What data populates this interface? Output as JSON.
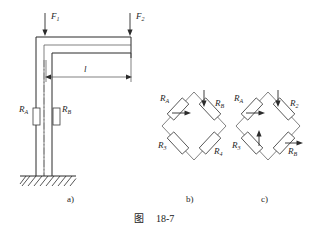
{
  "figure": {
    "caption_label": "图",
    "caption_number": "18-7",
    "parts": [
      {
        "id": "a",
        "label": "a)"
      },
      {
        "id": "b",
        "label": "b)"
      },
      {
        "id": "c",
        "label": "c)"
      }
    ]
  },
  "part_a": {
    "name": "cantilever-column-with-strain-gauges",
    "forces": [
      {
        "name": "F1",
        "base": "F",
        "sub": "1"
      },
      {
        "name": "F2",
        "base": "F",
        "sub": "2"
      }
    ],
    "dimension": {
      "name": "length-l",
      "label": "l"
    },
    "gauges": [
      {
        "name": "RA",
        "base": "R",
        "sub": "A"
      },
      {
        "name": "RB",
        "base": "R",
        "sub": "B"
      }
    ],
    "ground": {
      "name": "fixed-support-hatching"
    }
  },
  "part_b": {
    "name": "wheatstone-bridge-b",
    "arms": [
      {
        "position": "top-left",
        "base": "R",
        "sub": "A",
        "arrow": "right"
      },
      {
        "position": "top-right",
        "base": "R",
        "sub": "B",
        "arrow": "down"
      },
      {
        "position": "bottom-left",
        "base": "R",
        "sub": "3",
        "arrow": "none"
      },
      {
        "position": "bottom-right",
        "base": "R",
        "sub": "4",
        "arrow": "none"
      }
    ]
  },
  "part_c": {
    "name": "wheatstone-bridge-c",
    "arms": [
      {
        "position": "top-left",
        "base": "R",
        "sub": "A",
        "arrow": "right"
      },
      {
        "position": "top-right",
        "base": "R",
        "sub": "2",
        "arrow": "down"
      },
      {
        "position": "bottom-left",
        "base": "R",
        "sub": "3",
        "arrow": "up"
      },
      {
        "position": "bottom-right",
        "base": "R",
        "sub": "B",
        "arrow": "right"
      }
    ]
  },
  "colors": {
    "line": "#2b2b2b",
    "thin_line": "#4a4a4a",
    "center_line": "#6b6b6b",
    "text": "#1a1a1a",
    "background": "#ffffff"
  }
}
